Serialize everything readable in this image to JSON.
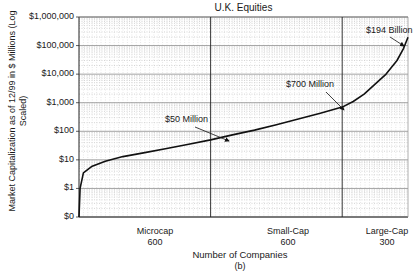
{
  "chart_data": {
    "type": "line",
    "title": "U.K. Equities",
    "subtitle": "(b)",
    "xlabel": "Number of Companies",
    "ylabel": "Market Capitalization as of 12/99 in $ Millions (Log Scaled)",
    "yscale": "log",
    "ylim": [
      0,
      1000000
    ],
    "y_ticks": [
      "$1,000,000",
      "$100,000",
      "$10,000",
      "$1,000",
      "$100",
      "$10",
      "$1",
      "$0"
    ],
    "grid": true,
    "segments": [
      {
        "name": "Microcap",
        "count": "600"
      },
      {
        "name": "Small-Cap",
        "count": "600"
      },
      {
        "name": "Large-Cap",
        "count": "300"
      }
    ],
    "series": [
      {
        "name": "U.K. Equities market cap (sorted ascending)",
        "x": [
          0,
          5,
          20,
          60,
          120,
          200,
          300,
          400,
          500,
          600,
          700,
          800,
          900,
          1000,
          1100,
          1200,
          1250,
          1300,
          1350,
          1400,
          1450,
          1480,
          1500
        ],
        "values": [
          0.1,
          1,
          3.5,
          6,
          9,
          13,
          18,
          25,
          35,
          50,
          75,
          110,
          170,
          270,
          430,
          700,
          1100,
          2000,
          4500,
          10000,
          30000,
          80000,
          194000
        ]
      }
    ],
    "annotations": [
      {
        "text": "$50 Million",
        "x": 600,
        "y": 50
      },
      {
        "text": "$700 Million",
        "x": 1200,
        "y": 700
      },
      {
        "text": "$194 Billion",
        "x": 1500,
        "y": 194000
      }
    ]
  }
}
